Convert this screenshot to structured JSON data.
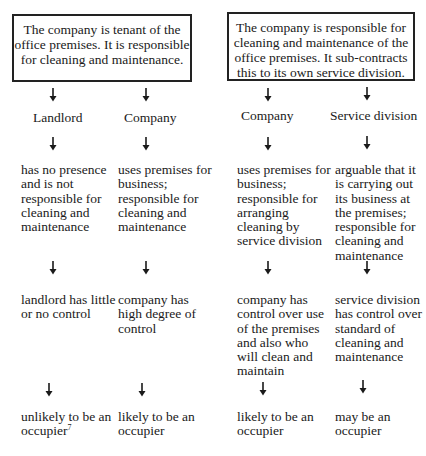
{
  "diagram": {
    "scenario_a": {
      "box_text": "The company is tenant of the office premises. It is responsible for cleaning and maintenance.",
      "columns": [
        {
          "party": "Landlord",
          "presence": "has no presence and is not responsible for cleaning and maintenance",
          "control": "landlord has little or no control",
          "conclusion": "unlikely to be an occupier",
          "footnote_ref": "7"
        },
        {
          "party": "Company",
          "presence": "uses premises for business; responsible for cleaning and maintenance",
          "control": "company has high degree of control",
          "conclusion": "likely to be an occupier"
        }
      ]
    },
    "scenario_b": {
      "box_text": "The company is responsible for cleaning and maintenance of the office premises. It sub-contracts this to its own service division.",
      "columns": [
        {
          "party": "Company",
          "presence": "uses premises for business; responsible for arranging cleaning by service division",
          "control": "company has control over use of the premises and also who will clean and maintain",
          "conclusion": "likely to be an occupier"
        },
        {
          "party": "Service division",
          "presence": "arguable that it is carrying out its business at the premises; responsible for cleaning and maintenance",
          "control": "service division has control over standard of cleaning and maintenance",
          "conclusion": "may be an occupier"
        }
      ]
    },
    "arrow_glyph": "down-arrow",
    "colors": {
      "text": "#1a1a1a",
      "border": "#222222",
      "background": "#ffffff"
    }
  }
}
